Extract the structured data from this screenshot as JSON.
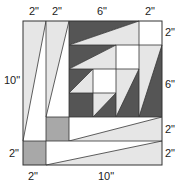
{
  "diagram": {
    "colors": {
      "dark": "#555555",
      "light": "#e6e6e6",
      "white": "#ffffff",
      "medium": "#a8a8a8",
      "line": "#333333"
    },
    "labels": {
      "top": [
        "2\"",
        "2\"",
        "6\"",
        "2\""
      ],
      "right": [
        "2\"",
        "6\"",
        "2\"",
        "2\""
      ],
      "left": [
        "10\"",
        "2\""
      ],
      "bottom": [
        "2\"",
        "10\""
      ]
    }
  }
}
